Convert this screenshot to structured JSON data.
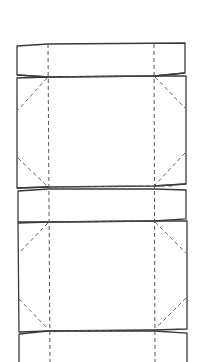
{
  "diagram": {
    "type": "box-net-template",
    "colors": {
      "background": "#ffffff",
      "cut_line": "#3a3a3a",
      "fold_line": "#555555"
    },
    "fold_x": [
      48,
      154
    ],
    "panels": [
      {
        "name": "top-flap",
        "kind": "flap",
        "y_top": 43,
        "y_bottom": 76
      },
      {
        "name": "panel-1",
        "kind": "panel",
        "y_top": 76,
        "y_bottom": 186
      },
      {
        "name": "middle-flap",
        "kind": "flap",
        "y_top": 189,
        "y_bottom": 220
      },
      {
        "name": "panel-2",
        "kind": "panel",
        "y_top": 221,
        "y_bottom": 331
      },
      {
        "name": "bottom-flap",
        "kind": "flap",
        "y_top": 333,
        "y_bottom": 362
      }
    ],
    "labels": []
  }
}
